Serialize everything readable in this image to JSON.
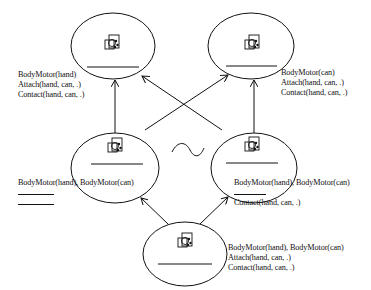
{
  "diagram": {
    "type": "lattice-of-states",
    "nodes": [
      {
        "id": "top-left",
        "labels": [
          "BodyMotor(hand)",
          "Attach(hand, can, .)",
          "Contact(hand, can, .)"
        ]
      },
      {
        "id": "top-right",
        "labels": [
          "BodyMotor(can)",
          "Attach(hand, can, .)",
          "Contact(hand, can, .)"
        ]
      },
      {
        "id": "middle-left",
        "labels": [
          "BodyMotor(hand), BodyMotor(can)",
          "",
          ""
        ]
      },
      {
        "id": "middle-right",
        "labels": [
          "BodyMotor(hand), BodyMotor(can)",
          "",
          "Contact(hand, can, .)"
        ]
      },
      {
        "id": "bottom",
        "labels": [
          "BodyMotor(hand), BodyMotor(can)",
          "Attach(hand, can, .)",
          "Contact(hand, can, .)"
        ]
      }
    ],
    "edges": [
      {
        "from": "bottom",
        "to": "middle-left"
      },
      {
        "from": "bottom",
        "to": "middle-right"
      },
      {
        "from": "middle-left",
        "to": "top-left"
      },
      {
        "from": "middle-left",
        "to": "top-right"
      },
      {
        "from": "middle-right",
        "to": "top-left"
      },
      {
        "from": "middle-right",
        "to": "top-right"
      }
    ],
    "equivalence_symbol": "~"
  }
}
